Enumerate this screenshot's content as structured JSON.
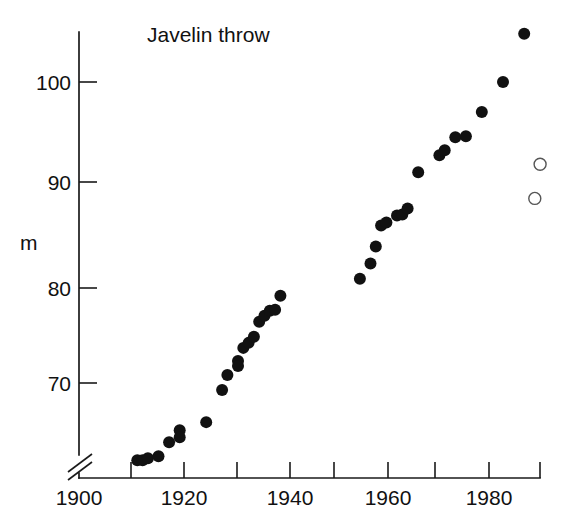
{
  "figure": {
    "title": "Javelin throw",
    "background_color": "#ffffff",
    "ink_color": "#111111"
  },
  "chart_data": {
    "type": "scatter",
    "title": "Javelin throw",
    "xlabel": "",
    "ylabel": "m",
    "xlim": [
      1900,
      1990
    ],
    "ylim": [
      62,
      107
    ],
    "grid": false,
    "legend": null,
    "axis_break": {
      "axis": "y",
      "symbol": "double-slash",
      "note": "y axis broken between 0 and ~62 m"
    },
    "x_ticks": [
      1900,
      1910,
      1920,
      1930,
      1940,
      1950,
      1960,
      1970,
      1980,
      1990
    ],
    "x_tick_labels": [
      "1900",
      "",
      "1920",
      "",
      "1940",
      "",
      "1960",
      "",
      "1980",
      ""
    ],
    "y_ticks": [
      70,
      80,
      90,
      100
    ],
    "y_tick_labels": [
      "70",
      "80",
      "90",
      "100"
    ],
    "series": [
      {
        "name": "world record (filled)",
        "marker": "filled-circle",
        "color": "#111111",
        "points": [
          {
            "x": 1911,
            "y": 62.3
          },
          {
            "x": 1912,
            "y": 62.3
          },
          {
            "x": 1913,
            "y": 62.5
          },
          {
            "x": 1915,
            "y": 62.7
          },
          {
            "x": 1917,
            "y": 64.1
          },
          {
            "x": 1919,
            "y": 65.3
          },
          {
            "x": 1919,
            "y": 64.6
          },
          {
            "x": 1924,
            "y": 66.1
          },
          {
            "x": 1927,
            "y": 69.3
          },
          {
            "x": 1928,
            "y": 70.8
          },
          {
            "x": 1930,
            "y": 72.2
          },
          {
            "x": 1930,
            "y": 71.7
          },
          {
            "x": 1931,
            "y": 73.5
          },
          {
            "x": 1932,
            "y": 74.0
          },
          {
            "x": 1933,
            "y": 74.6
          },
          {
            "x": 1934,
            "y": 76.1
          },
          {
            "x": 1935,
            "y": 76.7
          },
          {
            "x": 1936,
            "y": 77.2
          },
          {
            "x": 1937,
            "y": 77.3
          },
          {
            "x": 1938,
            "y": 78.7
          },
          {
            "x": 1953,
            "y": 80.4
          },
          {
            "x": 1955,
            "y": 81.9
          },
          {
            "x": 1956,
            "y": 83.6
          },
          {
            "x": 1957,
            "y": 85.7
          },
          {
            "x": 1958,
            "y": 86.0
          },
          {
            "x": 1960,
            "y": 86.7
          },
          {
            "x": 1961,
            "y": 86.8
          },
          {
            "x": 1962,
            "y": 87.4
          },
          {
            "x": 1964,
            "y": 91.0
          },
          {
            "x": 1968,
            "y": 92.7
          },
          {
            "x": 1969,
            "y": 93.2
          },
          {
            "x": 1971,
            "y": 94.5
          },
          {
            "x": 1973,
            "y": 94.6
          },
          {
            "x": 1976,
            "y": 97.0
          },
          {
            "x": 1980,
            "y": 100.0
          },
          {
            "x": 1984,
            "y": 104.8
          }
        ]
      },
      {
        "name": "new specification javelin (open)",
        "marker": "open-circle",
        "color": "#ffffff",
        "points": [
          {
            "x": 1986,
            "y": 88.4
          },
          {
            "x": 1987,
            "y": 91.8
          }
        ]
      }
    ]
  },
  "axes": {
    "y_axis_label": "m"
  }
}
